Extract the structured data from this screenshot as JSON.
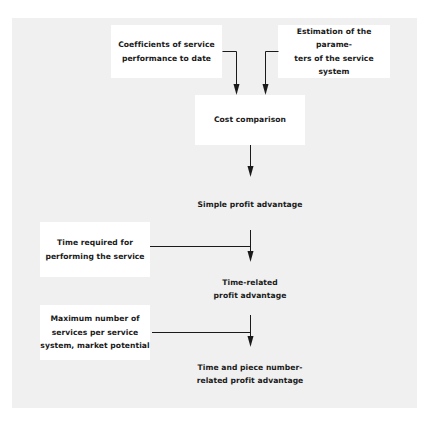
{
  "diagram": {
    "type": "flowchart",
    "colors": {
      "background": "#ffffff",
      "panel": "#f0f0f0",
      "box": "#ffffff",
      "line": "#1a1a1a",
      "text": "#1a1a1a"
    },
    "inputs": {
      "coefficients": "Coefficients of service\nperformance to date",
      "estimation": "Estimation of the parame-\nters of the service system",
      "time_required": "Time required for\nperforming the service",
      "max_services": "Maximum number of\nservices per service\nsystem, market potential"
    },
    "nodes": {
      "cost_comparison": "Cost comparison",
      "simple_profit": "Simple profit advantage",
      "time_related": "Time-related\nprofit advantage",
      "time_piece": "Time and piece number-\nrelated profit advantage"
    },
    "edges": [
      {
        "from": "Coefficients of service performance to date",
        "to": "Cost comparison"
      },
      {
        "from": "Estimation of the parameters of the service system",
        "to": "Cost comparison"
      },
      {
        "from": "Cost comparison",
        "to": "Simple profit advantage"
      },
      {
        "from": "Simple profit advantage",
        "to": "Time-related profit advantage"
      },
      {
        "from": "Time required for performing the service",
        "to": "Time-related profit advantage"
      },
      {
        "from": "Time-related profit advantage",
        "to": "Time and piece number-related profit advantage"
      },
      {
        "from": "Maximum number of services per service system, market potential",
        "to": "Time and piece number-related profit advantage"
      }
    ]
  }
}
